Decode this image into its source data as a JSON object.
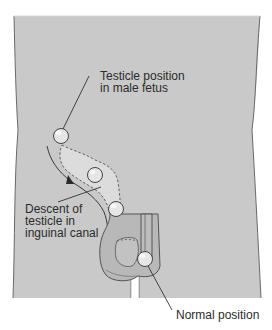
{
  "figure": {
    "colors": {
      "body_fill": "#c9c9c9",
      "body_outline": "#6a6a6a",
      "canal_fill": "#d9d9d9",
      "scrotum_fill": "#b8b8b8",
      "testicle_fill": "#e6e6e6",
      "line": "#333333",
      "text": "#2b2b2b",
      "background": "#ffffff"
    }
  },
  "labels": {
    "fetus": {
      "line1": "Testicle position",
      "line2": "in male fetus"
    },
    "descent": {
      "line1": "Descent of",
      "line2": "testicle in",
      "line3": "inguinal canal"
    },
    "normal": {
      "line1": "Normal position"
    }
  },
  "structures": [
    {
      "name": "testicle-fetal-position",
      "cx": 61,
      "cy": 136,
      "r": 8
    },
    {
      "name": "testicle-mid-canal",
      "cx": 95,
      "cy": 175,
      "r": 8
    },
    {
      "name": "testicle-canal-exit",
      "cx": 116,
      "cy": 209,
      "r": 8
    },
    {
      "name": "testicle-normal-position",
      "cx": 145,
      "cy": 260,
      "r": 8
    }
  ]
}
